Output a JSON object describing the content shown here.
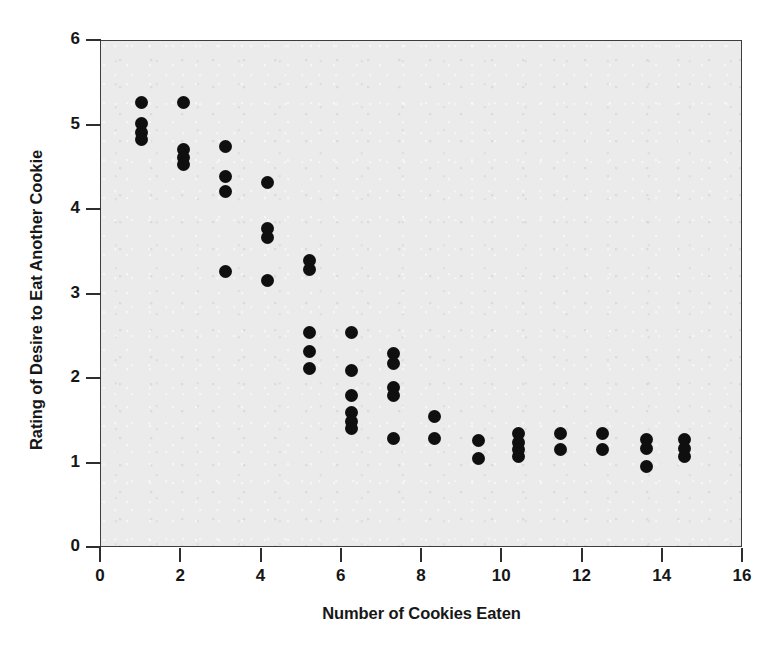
{
  "chart_data": {
    "type": "scatter",
    "title": "",
    "xlabel": "Number of Cookies Eaten",
    "ylabel": "Rating of Desire to Eat Another Cookie",
    "xlim": [
      0,
      16
    ],
    "ylim": [
      0,
      6
    ],
    "xticks": [
      0,
      2,
      4,
      6,
      8,
      10,
      12,
      14,
      16
    ],
    "yticks": [
      0,
      1,
      2,
      3,
      4,
      5,
      6
    ],
    "grid": false,
    "legend": null,
    "plot_background": "#ebebeb",
    "marker_color": "#100f0f",
    "marker_shape": "circle",
    "points": [
      {
        "x": 1.0,
        "y": 5.27
      },
      {
        "x": 1.0,
        "y": 5.02
      },
      {
        "x": 1.0,
        "y": 4.92
      },
      {
        "x": 1.0,
        "y": 4.84
      },
      {
        "x": 2.05,
        "y": 5.27
      },
      {
        "x": 2.05,
        "y": 4.72
      },
      {
        "x": 2.05,
        "y": 4.62
      },
      {
        "x": 2.05,
        "y": 4.54
      },
      {
        "x": 3.1,
        "y": 4.75
      },
      {
        "x": 3.1,
        "y": 4.4
      },
      {
        "x": 3.1,
        "y": 4.22
      },
      {
        "x": 3.1,
        "y": 3.27
      },
      {
        "x": 4.15,
        "y": 4.33
      },
      {
        "x": 4.15,
        "y": 3.78
      },
      {
        "x": 4.15,
        "y": 3.68
      },
      {
        "x": 4.15,
        "y": 3.17
      },
      {
        "x": 5.2,
        "y": 3.4
      },
      {
        "x": 5.2,
        "y": 3.3
      },
      {
        "x": 5.2,
        "y": 2.55
      },
      {
        "x": 5.2,
        "y": 2.33
      },
      {
        "x": 5.2,
        "y": 2.13
      },
      {
        "x": 6.25,
        "y": 2.55
      },
      {
        "x": 6.25,
        "y": 2.1
      },
      {
        "x": 6.25,
        "y": 1.8
      },
      {
        "x": 6.25,
        "y": 1.6
      },
      {
        "x": 6.25,
        "y": 1.5
      },
      {
        "x": 6.25,
        "y": 1.42
      },
      {
        "x": 7.3,
        "y": 2.3
      },
      {
        "x": 7.3,
        "y": 2.18
      },
      {
        "x": 7.3,
        "y": 1.9
      },
      {
        "x": 7.3,
        "y": 1.8
      },
      {
        "x": 7.3,
        "y": 1.3
      },
      {
        "x": 8.3,
        "y": 1.56
      },
      {
        "x": 8.3,
        "y": 1.3
      },
      {
        "x": 9.4,
        "y": 1.27
      },
      {
        "x": 9.4,
        "y": 1.06
      },
      {
        "x": 10.4,
        "y": 1.35
      },
      {
        "x": 10.4,
        "y": 1.25
      },
      {
        "x": 10.4,
        "y": 1.16
      },
      {
        "x": 10.4,
        "y": 1.08
      },
      {
        "x": 11.45,
        "y": 1.35
      },
      {
        "x": 11.45,
        "y": 1.17
      },
      {
        "x": 12.5,
        "y": 1.35
      },
      {
        "x": 12.5,
        "y": 1.17
      },
      {
        "x": 13.6,
        "y": 1.28
      },
      {
        "x": 13.6,
        "y": 1.18
      },
      {
        "x": 13.6,
        "y": 0.97
      },
      {
        "x": 14.55,
        "y": 1.28
      },
      {
        "x": 14.55,
        "y": 1.18
      },
      {
        "x": 14.55,
        "y": 1.08
      }
    ]
  }
}
